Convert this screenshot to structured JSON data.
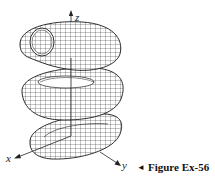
{
  "figure": {
    "caption_marker": "◄",
    "caption": "Figure Ex-56",
    "axes": {
      "x_label": "x",
      "y_label": "y",
      "z_label": "z"
    },
    "colors": {
      "ink": "#1a1a1a",
      "background": "#ffffff",
      "surface": "#ffffff"
    }
  }
}
